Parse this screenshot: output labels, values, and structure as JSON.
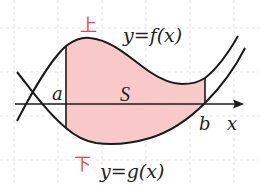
{
  "diagram": {
    "labels": {
      "upper_marker": "上",
      "lower_marker": "下",
      "upper_curve": "y=f(x)",
      "lower_curve": "y=g(x)",
      "a": "a",
      "b": "b",
      "x_axis": "x",
      "area": "S"
    },
    "colors": {
      "background": "#ffffff",
      "grid": "#d8d8d8",
      "curve": "#1a1a1a",
      "fill": "#f9c9c9",
      "marker": "#e5483f"
    }
  }
}
